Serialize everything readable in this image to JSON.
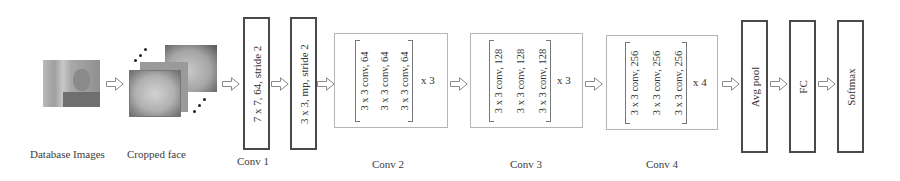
{
  "inputs": {
    "database_label": "Database Images",
    "cropped_label": "Cropped face"
  },
  "blocks": {
    "conv1": {
      "text": "7 x 7, 64, stride 2",
      "label": "Conv 1"
    },
    "maxpool": {
      "text": "3 x 3, mp, stride 2"
    },
    "conv2": {
      "rows": [
        "3 x 3 conv, 64",
        "3 x 3 conv, 64",
        "3 x 3 conv, 64"
      ],
      "repeat": "x 3",
      "label": "Conv 2"
    },
    "conv3": {
      "rows": [
        "3 x 3 conv, 128",
        "3 x 3 conv, 128",
        "3 x 3 conv, 128"
      ],
      "repeat": "x 3",
      "label": "Conv 3"
    },
    "conv4": {
      "rows": [
        "3 x 3 conv, 256",
        "3 x 3 conv, 256",
        "3 x 3 conv, 256"
      ],
      "repeat": "x 4",
      "label": "Conv 4"
    },
    "avgpool": {
      "text": "Avg pool"
    },
    "fc": {
      "text": "FC"
    },
    "softmax": {
      "text": "Softmax"
    }
  },
  "colors": {
    "box_border": "#4a4a4a",
    "dashed_border": "#b5b5b5",
    "arrow": "#8a8a8a",
    "text": "#333333"
  }
}
